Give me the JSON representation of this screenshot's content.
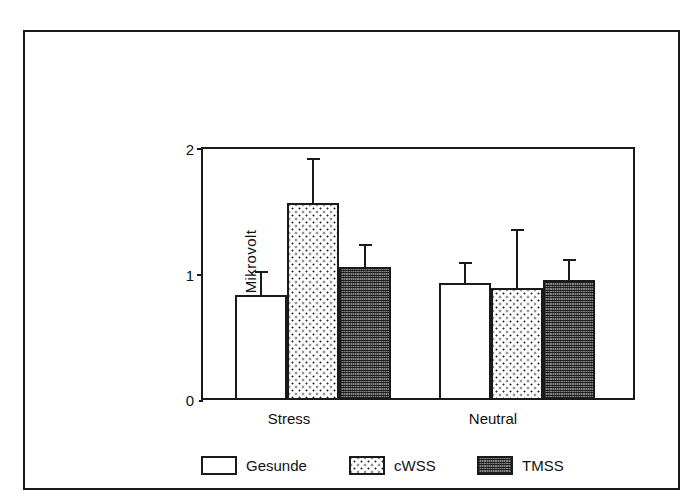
{
  "chart_data": {
    "type": "bar",
    "title": "",
    "subtitle": "",
    "xlabel": "",
    "ylabel": "Mikrovolt",
    "categories": [
      "Stress",
      "Neutral"
    ],
    "ylim": [
      0,
      2
    ],
    "yticks": [
      0,
      1,
      2
    ],
    "ytick_labels": [
      "0",
      "1",
      "2"
    ],
    "grid": false,
    "legend_position": "bottom",
    "series": [
      {
        "name": "Gesunde",
        "pattern": "empty",
        "values": [
          0.82,
          0.92
        ],
        "errors": [
          0.18,
          0.15
        ]
      },
      {
        "name": "cWSS",
        "pattern": "dots",
        "values": [
          1.55,
          0.88
        ],
        "errors": [
          0.35,
          0.45
        ]
      },
      {
        "name": "TMSS",
        "pattern": "dense",
        "values": [
          1.04,
          0.94
        ],
        "errors": [
          0.17,
          0.15
        ]
      }
    ]
  },
  "axis": {
    "y_label": "Mikrovolt",
    "tick_2": "2",
    "tick_1": "1",
    "tick_0": "0"
  },
  "x_labels": {
    "group_0": "Stress",
    "group_1": "Neutral"
  },
  "legend": {
    "item_0": "Gesunde",
    "item_1": "cWSS",
    "item_2": "TMSS"
  },
  "colors": {
    "ink": "#1a1a1a",
    "paper": "#ffffff",
    "dense_fill": "#6e6e6e"
  }
}
